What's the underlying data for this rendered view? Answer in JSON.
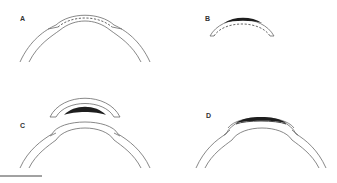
{
  "figure": {
    "panels": [
      {
        "id": "A",
        "label": "A",
        "description": "cornea with dashed resection plane within stroma"
      },
      {
        "id": "B",
        "label": "B",
        "description": "excised corneal cap with dark lenticule region and dashed cut line"
      },
      {
        "id": "C",
        "label": "C",
        "description": "separated cap with dark lenticule above corneal bed"
      },
      {
        "id": "D",
        "label": "D",
        "description": "cap replaced onto cornea with lenticule interface"
      }
    ],
    "scale_bar": {
      "label": ""
    },
    "colors": {
      "line": "#6a6a6a",
      "dark": "#1e1e1e",
      "background": "#ffffff"
    }
  }
}
